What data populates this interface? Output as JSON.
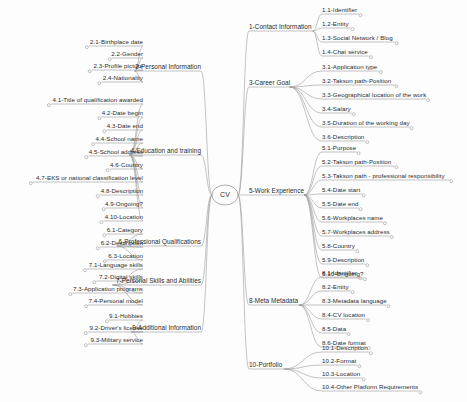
{
  "diagram": {
    "type": "mind-map",
    "center": {
      "label": "CV"
    },
    "colors": {
      "stroke": "#9a9a9a",
      "text": "#2b2b2b",
      "background": "#fdfdfd"
    },
    "branches": [
      {
        "id": "1",
        "label": "1-Contact Information",
        "side": "right",
        "children": [
          {
            "label": "1.1-Identifier"
          },
          {
            "label": "1.2-Entity"
          },
          {
            "label": "1.3-Social Network / Blog"
          },
          {
            "label": "1.4-Chat service"
          }
        ]
      },
      {
        "id": "3",
        "label": "3-Career Goal",
        "side": "right",
        "children": [
          {
            "label": "3.1-Application type"
          },
          {
            "label": "3.2-Takson path-Position"
          },
          {
            "label": "3.3-Geographical location of the work"
          },
          {
            "label": "3.4-Salary"
          },
          {
            "label": "3.5-Duration of the working day"
          },
          {
            "label": "3.6-Description"
          }
        ]
      },
      {
        "id": "5",
        "label": "5-Work Experience",
        "side": "right",
        "children": [
          {
            "label": "5.1-Purpose"
          },
          {
            "label": "5.2-Takson path-Position"
          },
          {
            "label": "5.3-Takson path - professional responsibility"
          },
          {
            "label": "5.4-Date start"
          },
          {
            "label": "5.5-Date end"
          },
          {
            "label": "5.6-Workplaces name"
          },
          {
            "label": "5.7-Workplaces address"
          },
          {
            "label": "5.8-Country"
          },
          {
            "label": "5.9-Description"
          },
          {
            "label": "5.10-Ongoing?"
          }
        ]
      },
      {
        "id": "8",
        "label": "8-Meta Metadata",
        "side": "right",
        "children": [
          {
            "label": "8.1-Identifier"
          },
          {
            "label": "8.2-Entity"
          },
          {
            "label": "8.3-Metadata language"
          },
          {
            "label": "8.4-CV location"
          },
          {
            "label": "8.5-Data"
          },
          {
            "label": "8.6-Date format"
          }
        ]
      },
      {
        "id": "10",
        "label": "10-Portfolio",
        "side": "right",
        "children": [
          {
            "label": "10.1-Description"
          },
          {
            "label": "10.2-Format"
          },
          {
            "label": "10.3-Location"
          },
          {
            "label": "10.4-Other Platform Requirements"
          }
        ]
      },
      {
        "id": "2",
        "label": "2-Personal Information",
        "side": "left",
        "children": [
          {
            "label": "2.1-Birthplace date"
          },
          {
            "label": "2.2-Gender"
          },
          {
            "label": "2.3-Profile picture"
          },
          {
            "label": "2.4-Nationality"
          }
        ]
      },
      {
        "id": "4",
        "label": "4-Education and training",
        "side": "left",
        "children": [
          {
            "label": "4.1-Title of qualification awarded"
          },
          {
            "label": "4.2-Date begin"
          },
          {
            "label": "4.3-Date end"
          },
          {
            "label": "4.4-School name"
          },
          {
            "label": "4.5-School address"
          },
          {
            "label": "4.6-Country"
          },
          {
            "label": "4.7-EKS or national classification level"
          },
          {
            "label": "4.8-Description"
          },
          {
            "label": "4.9-Ongoing?"
          },
          {
            "label": "4.10-Location"
          }
        ]
      },
      {
        "id": "6",
        "label": "6-Professional Qualifications",
        "side": "left",
        "children": [
          {
            "label": "6.1-Category"
          },
          {
            "label": "6.2-Description"
          },
          {
            "label": "6.3-Location"
          }
        ]
      },
      {
        "id": "7",
        "label": "7-Personal Skills and Abilities",
        "side": "left",
        "children": [
          {
            "label": "7.1-Language skills"
          },
          {
            "label": "7.2-Digital skills"
          },
          {
            "label": "7.3-Application programs"
          },
          {
            "label": "7.4-Personal model"
          }
        ]
      },
      {
        "id": "9",
        "label": "9-Additional Information",
        "side": "left",
        "children": [
          {
            "label": "9.1-Hobbies"
          },
          {
            "label": "9.2-Driver's license"
          },
          {
            "label": "9.3-Military service"
          }
        ]
      }
    ]
  }
}
